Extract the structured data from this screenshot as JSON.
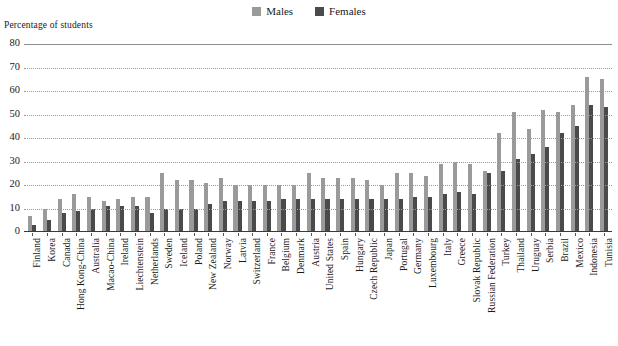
{
  "legend": {
    "items": [
      {
        "label": "Males",
        "color": "#9a9a9a",
        "name": "legend-males"
      },
      {
        "label": "Females",
        "color": "#4a4a4a",
        "name": "legend-females"
      }
    ]
  },
  "axis": {
    "y_title": "Percentage of students",
    "yticks": [
      "80",
      "70",
      "60",
      "50",
      "40",
      "30",
      "20",
      "10",
      "0"
    ]
  },
  "chart_data": {
    "type": "bar",
    "title": "",
    "subtitle": "",
    "xlabel": "",
    "ylabel": "Percentage of students",
    "ylim": [
      0,
      80
    ],
    "ytick_step": 10,
    "grid": true,
    "legend_position": "top-center",
    "orientation": "vertical",
    "grouped": true,
    "categories": [
      "Finland",
      "Korea",
      "Canada",
      "Hong Kong-China",
      "Australia",
      "Macao-China",
      "Ireland",
      "Liechtenstein",
      "Netherlands",
      "Sweden",
      "Iceland",
      "Poland",
      "New Zealand",
      "Norway",
      "Latvia",
      "Switzerland",
      "France",
      "Belgium",
      "Denmark",
      "Austria",
      "United States",
      "Spain",
      "Hungary",
      "Czech Republic",
      "Japan",
      "Portugal",
      "Germany",
      "Luxembourg",
      "Italy",
      "Greece",
      "Slovak Republic",
      "Russian Federation",
      "Turkey",
      "Thailand",
      "Uruguay",
      "Serbia",
      "Brazil",
      "Mexico",
      "Indonesia",
      "Tunisia"
    ],
    "series": [
      {
        "name": "Males",
        "color": "#9a9a9a",
        "values": [
          7,
          10,
          14,
          16,
          15,
          13,
          14,
          15,
          15,
          25,
          22,
          22,
          21,
          23,
          20,
          20,
          20,
          20,
          20,
          25,
          23,
          23,
          23,
          22,
          20,
          25,
          25,
          24,
          29,
          30,
          29,
          26,
          42,
          51,
          44,
          52,
          51,
          54,
          66,
          65
        ]
      },
      {
        "name": "Females",
        "color": "#4a4a4a",
        "values": [
          3,
          5,
          8,
          9,
          10,
          11,
          11,
          11,
          8,
          10,
          10,
          10,
          12,
          13,
          13,
          13,
          13,
          14,
          14,
          14,
          14,
          14,
          14,
          14,
          14,
          14,
          15,
          15,
          16,
          17,
          16,
          25,
          26,
          31,
          33,
          36,
          42,
          45,
          54,
          53
        ]
      }
    ]
  }
}
